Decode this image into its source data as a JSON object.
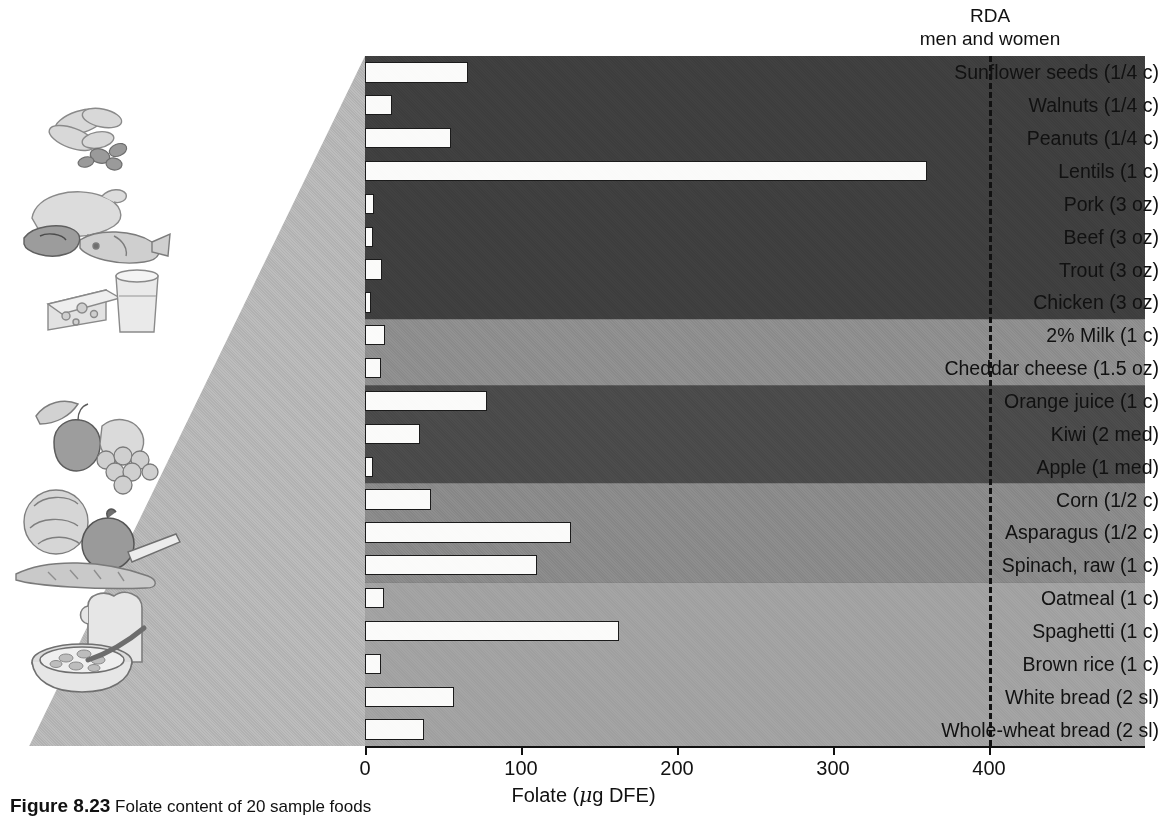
{
  "figure": {
    "rda_title": "RDA",
    "rda_subtitle": "men and women",
    "caption_label": "Figure 8.23",
    "caption_text": "Folate content of 20 sample foods"
  },
  "axis": {
    "title_prefix": "Folate (",
    "title_mu": "μ",
    "title_suffix": "g DFE)",
    "ticks": [
      "0",
      "100",
      "200",
      "300",
      "400"
    ],
    "tick_values": [
      0,
      100,
      200,
      300,
      400
    ],
    "min": 0,
    "max": 500
  },
  "rda": {
    "value": 400,
    "color": "#111111"
  },
  "groups": [
    {
      "name": "protein-foods",
      "color": "#3f3f3f",
      "start": 0,
      "end": 8
    },
    {
      "name": "dairy",
      "color": "#8e8e8e",
      "start": 8,
      "end": 10
    },
    {
      "name": "fruits",
      "color": "#4a4a4a",
      "start": 10,
      "end": 13
    },
    {
      "name": "vegetables",
      "color": "#8a8a8a",
      "start": 13,
      "end": 16
    },
    {
      "name": "grains",
      "color": "#a2a2a2",
      "start": 16,
      "end": 21
    }
  ],
  "chart_data": {
    "type": "bar",
    "orientation": "horizontal",
    "title": "",
    "xlabel": "Folate (μg DFE)",
    "ylabel": "",
    "xlim": [
      0,
      500
    ],
    "grid": false,
    "legend": "none",
    "annotations": [
      {
        "text": "RDA men and women",
        "x": 400,
        "style": "dashed-vertical-line"
      }
    ],
    "categories": [
      "Sunflower seeds (1/4 c)",
      "Walnuts (1/4 c)",
      "Peanuts (1/4 c)",
      "Lentils (1 c)",
      "Pork (3 oz)",
      "Beef (3 oz)",
      "Trout (3 oz)",
      "Chicken (3 oz)",
      "2% Milk (1 c)",
      "Cheddar cheese (1.5 oz)",
      "Orange juice (1 c)",
      "Kiwi (2 med)",
      "Apple (1 med)",
      "Corn (1/2 c)",
      "Asparagus (1/2 c)",
      "Spinach, raw (1 c)",
      "Oatmeal (1 c)",
      "Spaghetti (1 c)",
      "Brown rice (1 c)",
      "White bread (2 sl)",
      "Whole-wheat bread (2 sl)"
    ],
    "values": [
      66,
      17,
      55,
      360,
      6,
      5,
      11,
      4,
      13,
      10,
      78,
      35,
      5,
      42,
      132,
      110,
      12,
      163,
      10,
      57,
      38
    ]
  },
  "illustrations": [
    {
      "name": "nuts-illustration"
    },
    {
      "name": "meat-fish-illustration"
    },
    {
      "name": "cheese-milk-illustration"
    },
    {
      "name": "fruit-illustration"
    },
    {
      "name": "vegetables-illustration"
    },
    {
      "name": "bread-cereal-illustration"
    }
  ]
}
